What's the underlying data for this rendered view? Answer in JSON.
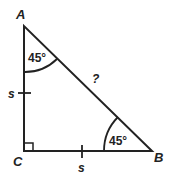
{
  "diagram": {
    "type": "right-isosceles-triangle",
    "vertices": {
      "A": {
        "label": "A"
      },
      "B": {
        "label": "B"
      },
      "C": {
        "label": "C"
      }
    },
    "angles": {
      "A": "45°",
      "B": "45°",
      "C": "right-angle"
    },
    "sides": {
      "AC": "s",
      "CB": "s",
      "AB": "?"
    },
    "stroke_color": "#222222"
  }
}
